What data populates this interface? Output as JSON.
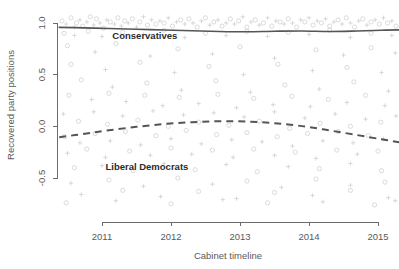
{
  "chart_data": {
    "type": "scatter",
    "title": "",
    "subtitle": "",
    "xlabel": "Cabinet timeline",
    "ylabel": "Recovered party positions",
    "xlim": [
      2010.35,
      2015.35
    ],
    "ylim": [
      -0.78,
      1.12
    ],
    "xticks": [
      2011,
      2012,
      2013,
      2014,
      2015
    ],
    "xticklabels": [
      "2011",
      "2012",
      "2013",
      "2014",
      "2015"
    ],
    "yticks": [
      1.0,
      0.5,
      0.0,
      -0.5
    ],
    "yticklabels": [
      "1.0",
      "0.5",
      "0.0",
      "-0.5"
    ],
    "grid": false,
    "legend": "inline-annotations",
    "point_color": "#c9c9c9",
    "point_symbols": [
      "circle",
      "plus"
    ],
    "annotations": [
      {
        "text": "Conservatives",
        "x": 2011.15,
        "y": 0.845
      },
      {
        "text": "Liberal Democrats",
        "x": 2011.05,
        "y": -0.425
      }
    ],
    "series": [
      {
        "name": "Conservatives",
        "style": "solid",
        "color": "#555555",
        "x": [
          2010.38,
          2010.75,
          2011.1,
          2011.5,
          2011.9,
          2012.3,
          2012.7,
          2013.1,
          2013.5,
          2013.9,
          2014.3,
          2014.7,
          2015.05,
          2015.32
        ],
        "y": [
          0.958,
          0.953,
          0.947,
          0.94,
          0.932,
          0.925,
          0.918,
          0.915,
          0.92,
          0.923,
          0.918,
          0.923,
          0.93,
          0.934
        ]
      },
      {
        "name": "Liberal Democrats",
        "style": "dashed",
        "color": "#555555",
        "x": [
          2010.38,
          2010.75,
          2011.1,
          2011.5,
          2011.9,
          2012.3,
          2012.7,
          2013.1,
          2013.5,
          2013.9,
          2014.3,
          2014.7,
          2015.05,
          2015.32
        ],
        "y": [
          -0.105,
          -0.072,
          -0.038,
          -0.005,
          0.022,
          0.04,
          0.05,
          0.046,
          0.03,
          0.002,
          -0.04,
          -0.085,
          -0.125,
          -0.155
        ]
      }
    ],
    "scatter_points": [
      [
        2010.42,
        1.02
      ],
      [
        2010.48,
        0.99
      ],
      [
        2010.55,
        1.05
      ],
      [
        2010.6,
        0.96
      ],
      [
        2010.63,
        1.0
      ],
      [
        2010.68,
        1.03
      ],
      [
        2010.72,
        0.97
      ],
      [
        2010.78,
        1.01
      ],
      [
        2010.83,
        1.06
      ],
      [
        2010.88,
        0.98
      ],
      [
        2010.92,
        1.04
      ],
      [
        2010.97,
        1.0
      ],
      [
        2011.02,
        0.95
      ],
      [
        2011.07,
        1.03
      ],
      [
        2011.12,
        1.01
      ],
      [
        2011.18,
        0.99
      ],
      [
        2011.23,
        1.05
      ],
      [
        2011.28,
        0.97
      ],
      [
        2011.33,
        1.02
      ],
      [
        2011.38,
        1.0
      ],
      [
        2011.44,
        1.04
      ],
      [
        2011.5,
        0.96
      ],
      [
        2011.55,
        1.01
      ],
      [
        2011.6,
        1.06
      ],
      [
        2011.66,
        0.98
      ],
      [
        2011.72,
        1.03
      ],
      [
        2011.78,
        0.99
      ],
      [
        2011.84,
        1.02
      ],
      [
        2011.9,
        1.0
      ],
      [
        2011.96,
        1.05
      ],
      [
        2012.02,
        0.97
      ],
      [
        2012.08,
        1.01
      ],
      [
        2012.14,
        1.03
      ],
      [
        2012.2,
        0.99
      ],
      [
        2012.26,
        1.04
      ],
      [
        2012.32,
        1.0
      ],
      [
        2012.38,
        0.96
      ],
      [
        2012.44,
        1.02
      ],
      [
        2012.5,
        1.05
      ],
      [
        2012.56,
        0.98
      ],
      [
        2012.62,
        1.01
      ],
      [
        2012.68,
        1.03
      ],
      [
        2012.74,
        0.97
      ],
      [
        2012.8,
        1.0
      ],
      [
        2012.86,
        1.04
      ],
      [
        2012.92,
        0.99
      ],
      [
        2012.98,
        1.02
      ],
      [
        2013.04,
        1.06
      ],
      [
        2013.1,
        0.96
      ],
      [
        2013.16,
        1.01
      ],
      [
        2013.22,
        1.03
      ],
      [
        2013.28,
        0.98
      ],
      [
        2013.34,
        1.0
      ],
      [
        2013.4,
        1.05
      ],
      [
        2013.46,
        0.97
      ],
      [
        2013.52,
        1.02
      ],
      [
        2013.58,
        1.01
      ],
      [
        2013.64,
        0.99
      ],
      [
        2013.7,
        1.04
      ],
      [
        2013.76,
        1.0
      ],
      [
        2013.82,
        0.96
      ],
      [
        2013.88,
        1.03
      ],
      [
        2013.94,
        1.01
      ],
      [
        2014.0,
        1.05
      ],
      [
        2014.06,
        0.98
      ],
      [
        2014.12,
        1.02
      ],
      [
        2014.18,
        1.0
      ],
      [
        2014.24,
        1.04
      ],
      [
        2014.3,
        0.97
      ],
      [
        2014.36,
        1.01
      ],
      [
        2014.42,
        1.03
      ],
      [
        2014.48,
        0.99
      ],
      [
        2014.54,
        1.05
      ],
      [
        2014.6,
        1.0
      ],
      [
        2014.66,
        0.96
      ],
      [
        2014.72,
        1.02
      ],
      [
        2014.78,
        1.04
      ],
      [
        2014.84,
        0.98
      ],
      [
        2014.9,
        1.01
      ],
      [
        2014.96,
        1.03
      ],
      [
        2015.02,
        0.99
      ],
      [
        2015.08,
        1.05
      ],
      [
        2015.14,
        1.0
      ],
      [
        2015.2,
        1.02
      ],
      [
        2015.26,
        0.97
      ],
      [
        2015.3,
        1.04
      ],
      [
        2010.45,
        0.9
      ],
      [
        2010.6,
        0.88
      ],
      [
        2010.8,
        0.92
      ],
      [
        2011.0,
        0.87
      ],
      [
        2011.3,
        0.91
      ],
      [
        2011.6,
        0.89
      ],
      [
        2011.9,
        0.93
      ],
      [
        2012.2,
        0.86
      ],
      [
        2012.5,
        0.9
      ],
      [
        2012.8,
        0.88
      ],
      [
        2013.1,
        0.92
      ],
      [
        2013.4,
        0.87
      ],
      [
        2013.7,
        0.91
      ],
      [
        2014.0,
        0.89
      ],
      [
        2014.3,
        0.93
      ],
      [
        2014.6,
        0.86
      ],
      [
        2014.9,
        0.9
      ],
      [
        2015.2,
        0.88
      ],
      [
        2010.5,
        0.78
      ],
      [
        2010.9,
        0.72
      ],
      [
        2011.2,
        0.8
      ],
      [
        2011.7,
        0.68
      ],
      [
        2012.1,
        0.75
      ],
      [
        2012.6,
        0.7
      ],
      [
        2013.0,
        0.77
      ],
      [
        2013.5,
        0.66
      ],
      [
        2014.1,
        0.74
      ],
      [
        2014.5,
        0.69
      ],
      [
        2014.9,
        0.76
      ],
      [
        2015.25,
        0.71
      ],
      [
        2010.55,
        0.6
      ],
      [
        2011.05,
        0.55
      ],
      [
        2011.55,
        0.62
      ],
      [
        2012.05,
        0.52
      ],
      [
        2012.55,
        0.58
      ],
      [
        2013.05,
        0.5
      ],
      [
        2013.55,
        0.6
      ],
      [
        2014.05,
        0.54
      ],
      [
        2014.55,
        0.57
      ],
      [
        2015.05,
        0.52
      ],
      [
        2010.7,
        0.45
      ],
      [
        2011.15,
        0.38
      ],
      [
        2011.65,
        0.42
      ],
      [
        2012.15,
        0.35
      ],
      [
        2012.65,
        0.44
      ],
      [
        2013.15,
        0.33
      ],
      [
        2013.65,
        0.4
      ],
      [
        2014.15,
        0.36
      ],
      [
        2014.65,
        0.43
      ],
      [
        2015.15,
        0.34
      ],
      [
        2010.52,
        0.3
      ],
      [
        2010.85,
        0.26
      ],
      [
        2011.1,
        0.32
      ],
      [
        2011.35,
        0.24
      ],
      [
        2011.62,
        0.3
      ],
      [
        2011.88,
        0.2
      ],
      [
        2012.12,
        0.28
      ],
      [
        2012.4,
        0.22
      ],
      [
        2012.68,
        0.31
      ],
      [
        2012.95,
        0.18
      ],
      [
        2013.2,
        0.27
      ],
      [
        2013.48,
        0.21
      ],
      [
        2013.75,
        0.29
      ],
      [
        2014.02,
        0.19
      ],
      [
        2014.28,
        0.26
      ],
      [
        2014.55,
        0.23
      ],
      [
        2014.82,
        0.3
      ],
      [
        2015.1,
        0.2
      ],
      [
        2015.28,
        0.27
      ],
      [
        2010.44,
        0.12
      ],
      [
        2010.66,
        0.05
      ],
      [
        2010.88,
        0.14
      ],
      [
        2011.08,
        0.02
      ],
      [
        2011.3,
        0.1
      ],
      [
        2011.52,
        0.06
      ],
      [
        2011.74,
        0.15
      ],
      [
        2011.96,
        0.0
      ],
      [
        2012.18,
        0.11
      ],
      [
        2012.4,
        0.04
      ],
      [
        2012.62,
        0.13
      ],
      [
        2012.84,
        0.01
      ],
      [
        2013.06,
        0.09
      ],
      [
        2013.28,
        0.05
      ],
      [
        2013.5,
        0.14
      ],
      [
        2013.72,
        -0.02
      ],
      [
        2013.94,
        0.08
      ],
      [
        2014.16,
        0.03
      ],
      [
        2014.38,
        0.12
      ],
      [
        2014.6,
        0.0
      ],
      [
        2014.82,
        0.07
      ],
      [
        2015.04,
        0.04
      ],
      [
        2015.26,
        0.1
      ],
      [
        2010.46,
        -0.1
      ],
      [
        2010.68,
        -0.16
      ],
      [
        2010.9,
        -0.07
      ],
      [
        2011.12,
        -0.14
      ],
      [
        2011.34,
        -0.05
      ],
      [
        2011.56,
        -0.18
      ],
      [
        2011.78,
        -0.09
      ],
      [
        2012.0,
        -0.12
      ],
      [
        2012.22,
        -0.04
      ],
      [
        2012.44,
        -0.17
      ],
      [
        2012.66,
        -0.08
      ],
      [
        2012.88,
        -0.13
      ],
      [
        2013.1,
        -0.06
      ],
      [
        2013.32,
        -0.15
      ],
      [
        2013.54,
        -0.1
      ],
      [
        2013.76,
        -0.19
      ],
      [
        2013.98,
        -0.07
      ],
      [
        2014.2,
        -0.14
      ],
      [
        2014.42,
        -0.05
      ],
      [
        2014.64,
        -0.16
      ],
      [
        2014.86,
        -0.09
      ],
      [
        2015.08,
        -0.12
      ],
      [
        2015.3,
        -0.06
      ],
      [
        2010.5,
        -0.26
      ],
      [
        2010.78,
        -0.22
      ],
      [
        2011.05,
        -0.3
      ],
      [
        2011.4,
        -0.24
      ],
      [
        2011.7,
        -0.28
      ],
      [
        2012.0,
        -0.21
      ],
      [
        2012.3,
        -0.27
      ],
      [
        2012.6,
        -0.23
      ],
      [
        2012.9,
        -0.3
      ],
      [
        2013.2,
        -0.22
      ],
      [
        2013.5,
        -0.28
      ],
      [
        2013.8,
        -0.25
      ],
      [
        2014.1,
        -0.31
      ],
      [
        2014.4,
        -0.23
      ],
      [
        2014.7,
        -0.27
      ],
      [
        2015.0,
        -0.24
      ],
      [
        2015.28,
        -0.29
      ],
      [
        2010.6,
        -0.4
      ],
      [
        2011.0,
        -0.38
      ],
      [
        2011.45,
        -0.43
      ],
      [
        2011.9,
        -0.36
      ],
      [
        2012.35,
        -0.42
      ],
      [
        2012.8,
        -0.37
      ],
      [
        2013.25,
        -0.44
      ],
      [
        2013.7,
        -0.39
      ],
      [
        2014.15,
        -0.41
      ],
      [
        2014.6,
        -0.36
      ],
      [
        2015.05,
        -0.43
      ],
      [
        2010.55,
        -0.55
      ],
      [
        2011.1,
        -0.52
      ],
      [
        2011.6,
        -0.58
      ],
      [
        2012.1,
        -0.5
      ],
      [
        2012.6,
        -0.56
      ],
      [
        2013.1,
        -0.53
      ],
      [
        2013.6,
        -0.59
      ],
      [
        2014.1,
        -0.51
      ],
      [
        2014.6,
        -0.57
      ],
      [
        2015.1,
        -0.54
      ],
      [
        2010.7,
        -0.66
      ],
      [
        2011.3,
        -0.62
      ],
      [
        2011.85,
        -0.68
      ],
      [
        2012.4,
        -0.63
      ],
      [
        2012.95,
        -0.7
      ],
      [
        2013.5,
        -0.64
      ],
      [
        2014.05,
        -0.67
      ],
      [
        2014.6,
        -0.62
      ],
      [
        2015.15,
        -0.69
      ],
      [
        2010.48,
        -0.74
      ],
      [
        2011.2,
        -0.72
      ],
      [
        2012.0,
        -0.75
      ],
      [
        2012.75,
        -0.71
      ],
      [
        2013.4,
        -0.74
      ],
      [
        2014.2,
        -0.73
      ],
      [
        2014.95,
        -0.76
      ],
      [
        2015.25,
        -0.72
      ]
    ]
  }
}
